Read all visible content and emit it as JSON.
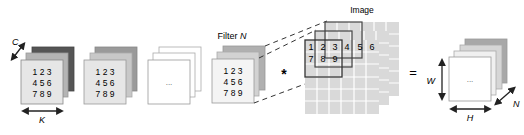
{
  "diagram": {
    "filter_stack_1": {
      "rows": [
        "1 2 3",
        "4 5 6",
        "7 8 9"
      ],
      "depth_label": "C",
      "width_label": "K",
      "layer_colors": [
        "#e6e6e6",
        "#b4b4b4",
        "#555555"
      ]
    },
    "filter_stack_2": {
      "rows": [
        "1 2 3",
        "4 5 6",
        "7 8 9"
      ],
      "layer_colors": [
        "#e6e6e6",
        "#c8c8c8",
        "#9a9a9a"
      ]
    },
    "filter_stack_3": {
      "ellipsis": "...",
      "layer_colors": [
        "#ffffff",
        "#ffffff",
        "#ffffff"
      ]
    },
    "filter_stack_n": {
      "label_prefix": "Filter ",
      "label_var": "N",
      "rows": [
        "1 2 3",
        "4 5 6",
        "7 8 9"
      ],
      "layer_colors": [
        "#f4f4f4",
        "#d2d2d2",
        "#b0b0b0"
      ]
    },
    "convolution_operator": "*",
    "image": {
      "label": "Image",
      "window_values_row1": [
        "1",
        "2",
        "3",
        "4",
        "5",
        "6"
      ],
      "window_values_row2": [
        "7",
        "8",
        "9"
      ],
      "grid_color": "#d9d9d9",
      "grid_cols": 6,
      "grid_rows": 6
    },
    "equals_operator": "=",
    "output_stack": {
      "ellipsis": "...",
      "height_label": "W",
      "width_label": "H",
      "depth_label": "N",
      "layer_colors": [
        "#ffffff",
        "#f0f0f0",
        "#d6d6d6",
        "#a8a8a8"
      ]
    }
  }
}
